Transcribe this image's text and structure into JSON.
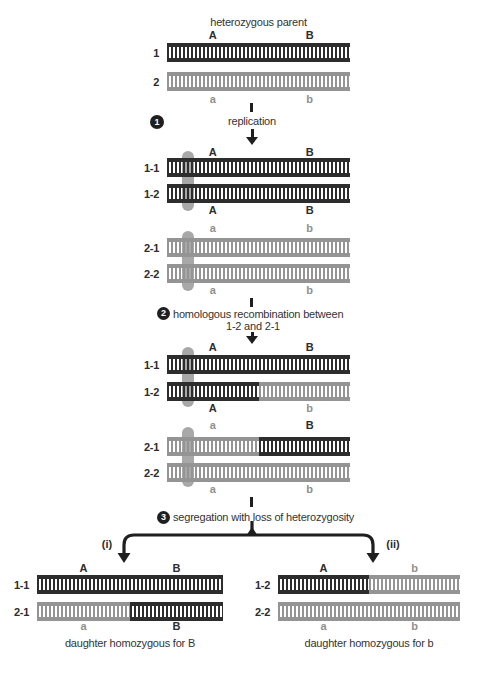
{
  "title": "heterozygous parent",
  "colors": {
    "dark_chromatid": "#2d2d2d",
    "light_chromatid": "#949494",
    "centromere": "#a8a8a8",
    "background": "#ffffff",
    "text": "#333333"
  },
  "step1": {
    "num": "1",
    "label": "replication"
  },
  "step2": {
    "num": "2",
    "line1": "homologous recombination between",
    "line2": "1-2 and 2-1"
  },
  "step3": {
    "num": "3",
    "label": "segregation with loss of heterozygosity"
  },
  "branch": {
    "left": "(i)",
    "right": "(ii)"
  },
  "parent": {
    "top_a": "A",
    "top_b": "B",
    "row1": "1",
    "row2": "2",
    "bot_a": "a",
    "bot_b": "b"
  },
  "rep_dark": {
    "top_a": "A",
    "top_b": "B",
    "row1": "1-1",
    "row2": "1-2",
    "bot_a": "A",
    "bot_b": "B"
  },
  "rep_light": {
    "top_a": "a",
    "top_b": "b",
    "row1": "2-1",
    "row2": "2-2",
    "bot_a": "a",
    "bot_b": "b"
  },
  "rec_dark": {
    "top_a": "A",
    "top_b": "B",
    "row1": "1-1",
    "row2": "1-2",
    "bot_a": "A",
    "bot_b": "b"
  },
  "rec_light": {
    "top_a": "a",
    "top_b": "B",
    "row1": "2-1",
    "row2": "2-2",
    "bot_a": "a",
    "bot_b": "b"
  },
  "daughter_left": {
    "top_a": "A",
    "top_b": "B",
    "row1": "1-1",
    "row2": "2-1",
    "bot_a": "a",
    "bot_b": "B",
    "caption": "daughter homozygous for B"
  },
  "daughter_right": {
    "top_a": "A",
    "top_b": "b",
    "row1": "1-2",
    "row2": "2-2",
    "bot_a": "a",
    "bot_b": "b",
    "caption": "daughter homozygous for b"
  }
}
